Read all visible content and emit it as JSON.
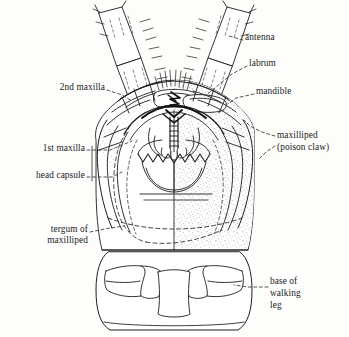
{
  "figure": {
    "style": {
      "line_color": "#1d1d1d",
      "stipple_color": "#6f6f6f",
      "background_color": "#fdfdfc",
      "shaded_half": "right"
    }
  },
  "labels": [
    {
      "id": "antenna",
      "text": "antenna",
      "x": 245,
      "y": 38,
      "align": "left"
    },
    {
      "id": "labrum",
      "text": "labrum",
      "x": 249,
      "y": 64,
      "align": "left"
    },
    {
      "id": "mandible",
      "text": "mandible",
      "x": 256,
      "y": 92,
      "align": "left"
    },
    {
      "id": "maxilliped-1",
      "text": "maxilliped",
      "x": 277,
      "y": 136,
      "align": "left"
    },
    {
      "id": "maxilliped-2",
      "text": "(poison claw)",
      "x": 277,
      "y": 148,
      "align": "left"
    },
    {
      "id": "second-maxilla",
      "text": "2nd maxilla",
      "x": 105,
      "y": 88,
      "align": "right"
    },
    {
      "id": "first-maxilla",
      "text": "1st maxilla",
      "x": 85,
      "y": 149,
      "align": "right"
    },
    {
      "id": "head-capsule",
      "text": "head capsule",
      "x": 85,
      "y": 176,
      "align": "right"
    },
    {
      "id": "tergum-1",
      "text": "tergum of",
      "x": 88,
      "y": 230,
      "align": "right"
    },
    {
      "id": "tergum-2",
      "text": "maxilliped",
      "x": 88,
      "y": 241,
      "align": "right"
    },
    {
      "id": "base-walking-1",
      "text": "base of",
      "x": 270,
      "y": 282,
      "align": "left"
    },
    {
      "id": "base-walking-2",
      "text": "walking",
      "x": 270,
      "y": 294,
      "align": "left"
    },
    {
      "id": "base-walking-3",
      "text": "leg",
      "x": 270,
      "y": 306,
      "align": "left"
    }
  ],
  "parts": [
    {
      "id": "antenna-left",
      "name": "left antenna",
      "segments": 4
    },
    {
      "id": "antenna-right",
      "name": "right antenna",
      "segments": 4
    },
    {
      "id": "labrum",
      "name": "labrum"
    },
    {
      "id": "mandible",
      "name": "mandible"
    },
    {
      "id": "first-maxilla",
      "name": "first maxilla"
    },
    {
      "id": "second-maxilla",
      "name": "second maxilla"
    },
    {
      "id": "maxilliped",
      "name": "maxilliped (poison claw)"
    },
    {
      "id": "head-capsule",
      "name": "head capsule"
    },
    {
      "id": "tergum",
      "name": "tergum of maxilliped"
    },
    {
      "id": "walking-leg-base",
      "name": "base of walking leg"
    }
  ]
}
